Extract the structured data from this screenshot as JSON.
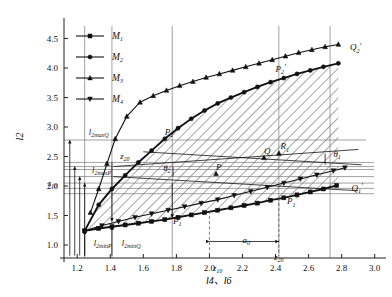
{
  "figure": {
    "title": "",
    "axis_x_label": "l4、l6",
    "axis_y_label": "l2"
  },
  "legend": {
    "items": [
      {
        "label": "M1",
        "marker": "square"
      },
      {
        "label": "M2",
        "marker": "circle"
      },
      {
        "label": "M3",
        "marker": "triangle-up"
      },
      {
        "label": "M4",
        "marker": "triangle-down"
      }
    ]
  },
  "chart_data": {
    "type": "line",
    "title": "",
    "xlabel": "l4、l6",
    "ylabel": "l2",
    "xlim": [
      1.12,
      3.02
    ],
    "ylim": [
      0.78,
      4.78
    ],
    "grid": true,
    "legend_position": "top-left",
    "xticks": [
      "1.2",
      "1.4",
      "1.6",
      "1.8",
      "2.0",
      "2.2",
      "2.4",
      "2.6",
      "2.8",
      "3.0"
    ],
    "xtick_values": [
      1.2,
      1.4,
      1.6,
      1.8,
      2.0,
      2.2,
      2.4,
      2.6,
      2.8,
      3.0
    ],
    "yticks": [
      "1.0",
      "1.5",
      "2.0",
      "2.5",
      "3.0",
      "3.5",
      "4.0",
      "4.5"
    ],
    "ytick_values": [
      1.0,
      1.5,
      2.0,
      2.5,
      3.0,
      3.5,
      4.0,
      4.5
    ],
    "series": [
      {
        "name": "M1",
        "marker": "square",
        "comment": "lower boundary curve P1 -> P1' -> Q1'",
        "points": [
          [
            1.245,
            1.24
          ],
          [
            1.33,
            1.28
          ],
          [
            1.41,
            1.31
          ],
          [
            1.49,
            1.34
          ],
          [
            1.57,
            1.37
          ],
          [
            1.65,
            1.4
          ],
          [
            1.73,
            1.43
          ],
          [
            1.81,
            1.47
          ],
          [
            1.89,
            1.51
          ],
          [
            1.97,
            1.55
          ],
          [
            2.05,
            1.59
          ],
          [
            2.13,
            1.63
          ],
          [
            2.21,
            1.67
          ],
          [
            2.29,
            1.71
          ],
          [
            2.37,
            1.76
          ],
          [
            2.45,
            1.8
          ],
          [
            2.53,
            1.85
          ],
          [
            2.61,
            1.9
          ],
          [
            2.69,
            1.95
          ],
          [
            2.77,
            2.01
          ]
        ]
      },
      {
        "name": "M2",
        "marker": "circle",
        "comment": "upper boundary curve P2 -> P2' -> Q2' (bold)",
        "points": [
          [
            1.245,
            1.24
          ],
          [
            1.33,
            1.68
          ],
          [
            1.41,
            1.95
          ],
          [
            1.49,
            2.18
          ],
          [
            1.57,
            2.4
          ],
          [
            1.65,
            2.6
          ],
          [
            1.73,
            2.8
          ],
          [
            1.81,
            2.98
          ],
          [
            1.89,
            3.14
          ],
          [
            1.97,
            3.28
          ],
          [
            2.05,
            3.4
          ],
          [
            2.13,
            3.5
          ],
          [
            2.21,
            3.59
          ],
          [
            2.29,
            3.68
          ],
          [
            2.37,
            3.76
          ],
          [
            2.45,
            3.83
          ],
          [
            2.53,
            3.9
          ],
          [
            2.61,
            3.96
          ],
          [
            2.69,
            4.02
          ],
          [
            2.78,
            4.08
          ]
        ]
      },
      {
        "name": "M3",
        "marker": "triangle-up",
        "comment": "upper thin curve reaching Q2'",
        "points": [
          [
            1.28,
            1.55
          ],
          [
            1.33,
            1.95
          ],
          [
            1.38,
            2.38
          ],
          [
            1.43,
            2.8
          ],
          [
            1.5,
            3.18
          ],
          [
            1.58,
            3.42
          ],
          [
            1.66,
            3.53
          ],
          [
            1.74,
            3.62
          ],
          [
            1.82,
            3.7
          ],
          [
            1.9,
            3.77
          ],
          [
            1.98,
            3.84
          ],
          [
            2.06,
            3.9
          ],
          [
            2.14,
            3.96
          ],
          [
            2.22,
            4.02
          ],
          [
            2.3,
            4.08
          ],
          [
            2.38,
            4.14
          ],
          [
            2.46,
            4.2
          ],
          [
            2.54,
            4.26
          ],
          [
            2.62,
            4.31
          ],
          [
            2.7,
            4.36
          ],
          [
            2.78,
            4.4
          ]
        ]
      },
      {
        "name": "M4",
        "marker": "triangle-down",
        "comment": "lower thin curve reaching Q1'",
        "points": [
          [
            1.245,
            1.24
          ],
          [
            1.35,
            1.33
          ],
          [
            1.45,
            1.4
          ],
          [
            1.55,
            1.47
          ],
          [
            1.65,
            1.53
          ],
          [
            1.75,
            1.59
          ],
          [
            1.85,
            1.65
          ],
          [
            1.95,
            1.71
          ],
          [
            2.05,
            1.77
          ],
          [
            2.15,
            1.84
          ],
          [
            2.25,
            1.91
          ],
          [
            2.35,
            1.98
          ],
          [
            2.45,
            2.05
          ],
          [
            2.55,
            2.12
          ],
          [
            2.65,
            2.19
          ],
          [
            2.75,
            2.26
          ],
          [
            2.82,
            2.31
          ]
        ]
      }
    ],
    "annotations": [
      {
        "text": "P2",
        "x": 1.73,
        "y": 2.86
      },
      {
        "text": "P2'",
        "x": 2.4,
        "y": 3.93
      },
      {
        "text": "Q2'",
        "x": 2.85,
        "y": 4.3
      },
      {
        "text": "P1",
        "x": 1.78,
        "y": 1.36
      },
      {
        "text": "P1'",
        "x": 2.47,
        "y": 1.69
      },
      {
        "text": "Q1'",
        "x": 2.86,
        "y": 1.92
      },
      {
        "text": "P",
        "x": 2.04,
        "y": 2.28
      },
      {
        "text": "Q",
        "x": 2.33,
        "y": 2.54
      },
      {
        "text": "R1",
        "x": 2.43,
        "y": 2.62
      },
      {
        "text": "θ1",
        "x": 2.75,
        "y": 2.5
      },
      {
        "text": "θ2",
        "x": 1.72,
        "y": 2.25
      },
      {
        "text": "a0",
        "x": 2.2,
        "y": 1.03
      }
    ],
    "reference_lines_y": [
      {
        "label": "l2maxQ",
        "value": 2.78
      },
      {
        "label": "z20",
        "value": 2.4
      },
      {
        "label": "l2maxP",
        "value": 2.28
      },
      {
        "label": "",
        "value": 2.33
      },
      {
        "label": "",
        "value": 2.16
      },
      {
        "label": "",
        "value": 2.05
      },
      {
        "label": "",
        "value": 1.96
      },
      {
        "label": "",
        "value": 1.87
      }
    ],
    "reference_lines_x": [
      {
        "label": "l2minP",
        "value": 1.245
      },
      {
        "label": "l2minQ",
        "value": 1.41
      },
      {
        "label": "",
        "value": 1.775
      },
      {
        "label": "",
        "value": 2.42
      },
      {
        "label": "",
        "value": 2.73
      }
    ],
    "axis_markers": [
      {
        "label": "z10",
        "axis": "both",
        "value": 2.05
      },
      {
        "label": "z20",
        "axis": "both",
        "value": 2.4
      }
    ]
  },
  "labels": {
    "l2maxQ": "l2maxQ",
    "l2maxP": "l2maxP",
    "l2minP": "l2minP",
    "l2minQ": "l2minQ",
    "z10": "z10",
    "z20": "z20",
    "a0": "a0",
    "theta1": "θ1",
    "theta2": "θ2",
    "P": "P",
    "Q": "Q",
    "P1": "P1",
    "P2": "P2",
    "P1p": "P1'",
    "P2p": "P2'",
    "Q1p": "Q1'",
    "Q2p": "Q2'",
    "R1": "R1"
  }
}
